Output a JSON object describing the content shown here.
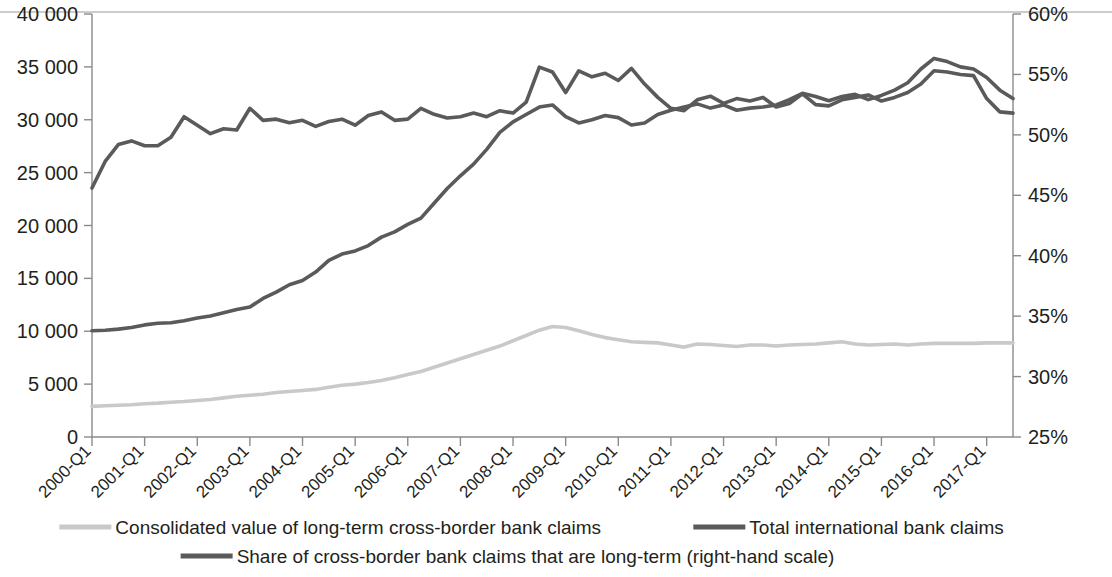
{
  "chart_data": {
    "type": "line",
    "title": "",
    "xlabel": "",
    "ylabel": "",
    "grid": false,
    "legend_position": "bottom",
    "x": [
      "2000-Q1",
      "2000-Q2",
      "2000-Q3",
      "2000-Q4",
      "2001-Q1",
      "2001-Q2",
      "2001-Q3",
      "2001-Q4",
      "2002-Q1",
      "2002-Q2",
      "2002-Q3",
      "2002-Q4",
      "2003-Q1",
      "2003-Q2",
      "2003-Q3",
      "2003-Q4",
      "2004-Q1",
      "2004-Q2",
      "2004-Q3",
      "2004-Q4",
      "2005-Q1",
      "2005-Q2",
      "2005-Q3",
      "2005-Q4",
      "2006-Q1",
      "2006-Q2",
      "2006-Q3",
      "2006-Q4",
      "2007-Q1",
      "2007-Q2",
      "2007-Q3",
      "2007-Q4",
      "2008-Q1",
      "2008-Q2",
      "2008-Q3",
      "2008-Q4",
      "2009-Q1",
      "2009-Q2",
      "2009-Q3",
      "2009-Q4",
      "2010-Q1",
      "2010-Q2",
      "2010-Q3",
      "2010-Q4",
      "2011-Q1",
      "2011-Q2",
      "2011-Q3",
      "2011-Q4",
      "2012-Q1",
      "2012-Q2",
      "2012-Q3",
      "2012-Q4",
      "2013-Q1",
      "2013-Q2",
      "2013-Q3",
      "2013-Q4",
      "2014-Q1",
      "2014-Q2",
      "2014-Q3",
      "2014-Q4",
      "2015-Q1",
      "2015-Q2",
      "2015-Q3",
      "2015-Q4",
      "2016-Q1",
      "2016-Q2",
      "2016-Q3",
      "2016-Q4",
      "2017-Q1",
      "2017-Q2",
      "2017-Q3"
    ],
    "x_tick_labels": [
      "2000-Q1",
      "2001-Q1",
      "2002-Q1",
      "2003-Q1",
      "2004-Q1",
      "2005-Q1",
      "2006-Q1",
      "2007-Q1",
      "2008-Q1",
      "2009-Q1",
      "2010-Q1",
      "2011-Q1",
      "2012-Q1",
      "2013-Q1",
      "2014-Q1",
      "2015-Q1",
      "2016-Q1",
      "2017-Q1"
    ],
    "x_tick_indices": [
      0,
      4,
      8,
      12,
      16,
      20,
      24,
      28,
      32,
      36,
      40,
      44,
      48,
      52,
      56,
      60,
      64,
      68
    ],
    "left_axis": {
      "ticks": [
        "0",
        "5 000",
        "10 000",
        "15 000",
        "20 000",
        "25 000",
        "30 000",
        "35 000",
        "40 000"
      ],
      "min": 0,
      "max": 40000,
      "step": 5000
    },
    "right_axis": {
      "ticks": [
        "25%",
        "30%",
        "35%",
        "40%",
        "45%",
        "50%",
        "55%",
        "60%"
      ],
      "min": 25,
      "max": 60,
      "step": 5
    },
    "series": [
      {
        "name": "Consolidated value of long-term cross-border bank claims",
        "axis": "left",
        "color": "#c9c9c9",
        "values": [
          2900,
          2950,
          3000,
          3050,
          3150,
          3200,
          3280,
          3350,
          3450,
          3550,
          3700,
          3850,
          3950,
          4050,
          4200,
          4300,
          4400,
          4500,
          4700,
          4900,
          5000,
          5150,
          5350,
          5600,
          5900,
          6200,
          6600,
          7000,
          7400,
          7800,
          8200,
          8600,
          9100,
          9600,
          10100,
          10450,
          10350,
          10050,
          9700,
          9400,
          9200,
          9000,
          8950,
          8900,
          8700,
          8500,
          8800,
          8750,
          8650,
          8550,
          8700,
          8700,
          8600,
          8700,
          8750,
          8800,
          8900,
          9000,
          8800,
          8700,
          8750,
          8800,
          8700,
          8800,
          8850,
          8850,
          8850,
          8850,
          8900,
          8900,
          8900
        ]
      },
      {
        "name": "Total international bank claims",
        "axis": "left",
        "color": "#5a5a5a",
        "values": [
          10050,
          10100,
          10200,
          10350,
          10600,
          10750,
          10800,
          11000,
          11250,
          11450,
          11750,
          12050,
          12300,
          13100,
          13700,
          14400,
          14800,
          15600,
          16700,
          17300,
          17600,
          18100,
          18900,
          19400,
          20100,
          20700,
          22100,
          23500,
          24700,
          25800,
          27200,
          28800,
          29800,
          30500,
          31200,
          31400,
          30300,
          29700,
          30000,
          30400,
          30200,
          29500,
          29700,
          30500,
          30900,
          31200,
          31500,
          31100,
          31400,
          30900,
          31100,
          31200,
          31400,
          31900,
          32500,
          32200,
          31800,
          32200,
          32400,
          31900,
          32300,
          32800,
          33500,
          34800,
          35800,
          35500,
          35000,
          34800,
          34000,
          32800,
          32000
        ]
      },
      {
        "name": "Share of cross-border bank claims that are long-term (right-hand scale)",
        "axis": "right",
        "color": "#5a5a5a",
        "values": [
          45.6,
          47.8,
          49.2,
          49.5,
          49.1,
          49.1,
          49.8,
          51.5,
          50.8,
          50.1,
          50.5,
          50.4,
          52.2,
          51.2,
          51.3,
          51.0,
          51.2,
          50.7,
          51.1,
          51.3,
          50.8,
          51.6,
          51.9,
          51.2,
          51.3,
          52.2,
          51.7,
          51.4,
          51.5,
          51.8,
          51.5,
          52.0,
          51.8,
          52.7,
          55.6,
          55.2,
          53.5,
          55.3,
          54.8,
          55.1,
          54.5,
          55.5,
          54.2,
          53.1,
          52.2,
          52.0,
          52.9,
          53.2,
          52.6,
          53.0,
          52.8,
          53.1,
          52.3,
          52.6,
          53.4,
          52.5,
          52.4,
          52.9,
          53.1,
          53.3,
          52.8,
          53.1,
          53.5,
          54.2,
          55.3,
          55.2,
          55.0,
          54.9,
          53.0,
          51.9,
          51.8
        ]
      }
    ]
  },
  "legend": {
    "items": [
      {
        "label": "Consolidated value of long-term cross-border bank claims",
        "color": "#c9c9c9"
      },
      {
        "label": "Total international bank claims",
        "color": "#5a5a5a"
      },
      {
        "label": "Share of cross-border bank claims that are long-term (right-hand scale)",
        "color": "#5a5a5a"
      }
    ]
  }
}
